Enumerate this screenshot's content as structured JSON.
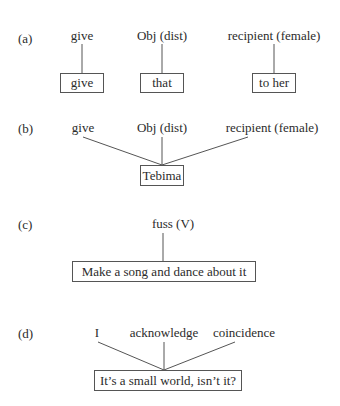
{
  "panels": [
    {
      "tag": "(a)",
      "labels": [
        "give",
        "Obj (dist)",
        "recipient (female)"
      ],
      "boxes": [
        "give",
        "that",
        "to her"
      ]
    },
    {
      "tag": "(b)",
      "labels": [
        "give",
        "Obj (dist)",
        "recipient (female)"
      ],
      "boxes": [
        "Tebima"
      ]
    },
    {
      "tag": "(c)",
      "labels": [
        "fuss (V)"
      ],
      "boxes": [
        "Make a song and dance about it"
      ]
    },
    {
      "tag": "(d)",
      "labels": [
        "I",
        "acknowledge",
        "coincidence"
      ],
      "boxes": [
        "It’s a small world, isn’t it?"
      ]
    }
  ],
  "colors": {
    "line": "#555555",
    "text": "#2b2b2b",
    "background": "#ffffff"
  }
}
